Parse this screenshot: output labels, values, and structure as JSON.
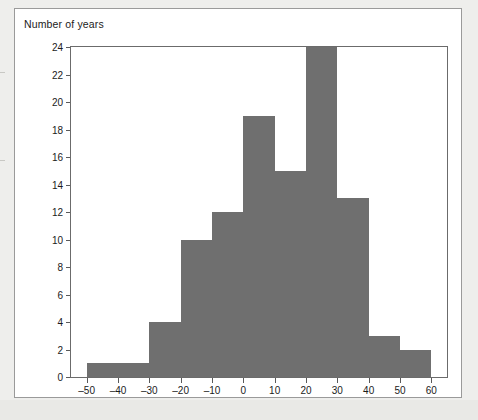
{
  "figure": {
    "axis_title": "Number of years",
    "bar_color": "#6f6f6f",
    "frame_color": "#6b6b6b",
    "card_background": "#ffffff",
    "page_background": "#eeeeec"
  },
  "chart_data": {
    "type": "bar",
    "title": "",
    "subtitle": "",
    "xlabel": "",
    "ylabel": "Number of years",
    "ylim": [
      0,
      24
    ],
    "xlim": [
      -55,
      65
    ],
    "grid": false,
    "legend": null,
    "y_ticks": [
      0,
      2,
      4,
      6,
      8,
      10,
      12,
      14,
      16,
      18,
      20,
      22,
      24
    ],
    "y_tick_labels": [
      "0",
      "2",
      "4",
      "6",
      "8",
      "10",
      "12",
      "14",
      "16",
      "18",
      "20",
      "22",
      "24"
    ],
    "x_ticks": [
      -50,
      -40,
      -30,
      -20,
      -10,
      0,
      10,
      20,
      30,
      40,
      50,
      60
    ],
    "x_tick_labels": [
      "–50",
      "–40",
      "–30",
      "–20",
      "–10",
      "0",
      "10",
      "20",
      "30",
      "40",
      "50",
      "60"
    ],
    "bin_width": 10,
    "bins": [
      {
        "left": -50,
        "right": -40,
        "center": -45,
        "value": 1
      },
      {
        "left": -40,
        "right": -30,
        "center": -35,
        "value": 1
      },
      {
        "left": -30,
        "right": -20,
        "center": -25,
        "value": 4
      },
      {
        "left": -20,
        "right": -10,
        "center": -15,
        "value": 10
      },
      {
        "left": -10,
        "right": 0,
        "center": -5,
        "value": 12
      },
      {
        "left": 0,
        "right": 10,
        "center": 5,
        "value": 19
      },
      {
        "left": 10,
        "right": 20,
        "center": 15,
        "value": 15
      },
      {
        "left": 20,
        "right": 30,
        "center": 25,
        "value": 24
      },
      {
        "left": 30,
        "right": 40,
        "center": 35,
        "value": 13
      },
      {
        "left": 40,
        "right": 50,
        "center": 45,
        "value": 3
      },
      {
        "left": 50,
        "right": 60,
        "center": 55,
        "value": 2
      }
    ],
    "categories": [
      "–50 to –40",
      "–40 to –30",
      "–30 to –20",
      "–20 to –10",
      "–10 to 0",
      "0 to 10",
      "10 to 20",
      "20 to 30",
      "30 to 40",
      "40 to 50",
      "50 to 60"
    ],
    "values": [
      1,
      1,
      4,
      10,
      12,
      19,
      15,
      24,
      13,
      3,
      2
    ]
  }
}
